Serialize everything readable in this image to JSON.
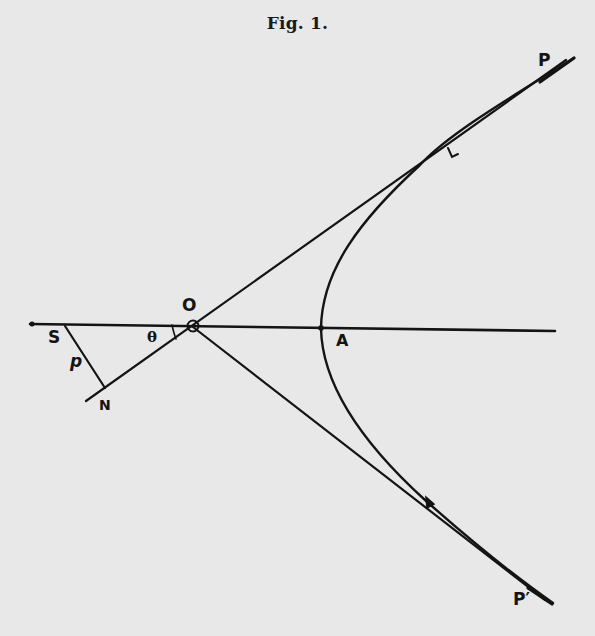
{
  "figure": {
    "title": "Fig. 1."
  },
  "labels": {
    "S": "S",
    "p": "p",
    "N": "N",
    "theta": "θ",
    "O": "O",
    "A": "A",
    "P": "P",
    "P_prime": "P′"
  },
  "colors": {
    "background": "#e8e8e8",
    "ink": "#141414"
  },
  "geometry": {
    "axis": {
      "x1": 30,
      "y1": 324,
      "x2": 555,
      "y2": 331
    },
    "origin_O": {
      "x": 193,
      "y": 326
    },
    "focus_S": {
      "x": 62,
      "y": 325
    },
    "foot_N": {
      "x": 105,
      "y": 389
    },
    "vertex_A": {
      "x": 322,
      "y": 328
    },
    "asymptote_upper_end": {
      "x": 574,
      "y": 60
    },
    "asymptote_lower_end": {
      "x": 553,
      "y": 603
    }
  }
}
